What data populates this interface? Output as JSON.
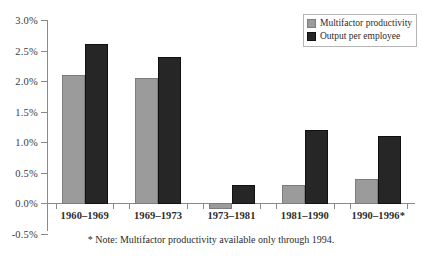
{
  "chart_data": {
    "type": "bar",
    "title": "",
    "xlabel": "",
    "ylabel": "",
    "ylim": [
      -0.5,
      3.0
    ],
    "ytick_step": 0.5,
    "grid": false,
    "legend_position": "top-right",
    "categories": [
      "1960–1969",
      "1969–1973",
      "1973–1981",
      "1981–1990",
      "1990–1996*"
    ],
    "ytick_labels": [
      "3.0%",
      "2.5%",
      "2.0%",
      "1.5%",
      "1.0%",
      "0.5%",
      "0.0%",
      "-0.5%"
    ],
    "ytick_values": [
      3.0,
      2.5,
      2.0,
      1.5,
      1.0,
      0.5,
      0.0,
      -0.5
    ],
    "series": [
      {
        "name": "Multifactor productivity",
        "color": "#9b9b9b",
        "values": [
          2.1,
          2.05,
          -0.1,
          0.3,
          0.4
        ]
      },
      {
        "name": "Output per employee",
        "color": "#262626",
        "values": [
          2.6,
          2.4,
          0.3,
          1.2,
          1.1
        ]
      }
    ],
    "annotations": [
      "* Note: Multifactor productivity available only through 1994."
    ]
  },
  "legend": {
    "items": [
      {
        "label": "Multifactor productivity",
        "swatch": "light"
      },
      {
        "label": "Output per employee",
        "swatch": "dark"
      }
    ]
  },
  "footnote": {
    "text": "* Note: Multifactor productivity available only through 1994."
  }
}
